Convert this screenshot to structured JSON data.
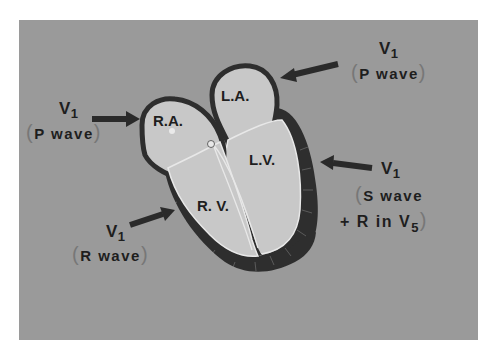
{
  "diagram": {
    "type": "heart-cross-section",
    "chambers": {
      "ra": "R.A.",
      "la": "L.A.",
      "rv": "R. V.",
      "lv": "L.V."
    },
    "annotations": {
      "la_lead": {
        "lead": "V",
        "sub": "1",
        "wave": "P wave",
        "open": "(",
        "close": ")"
      },
      "ra_lead": {
        "lead": "V",
        "sub": "1",
        "wave": "P wave",
        "open": "(",
        "close": ")"
      },
      "lv_lead": {
        "lead": "V",
        "sub": "1",
        "wave_line1": "S wave",
        "wave_line2_prefix": "+ R in V",
        "wave_line2_sub": "5",
        "open": "(",
        "close": ")"
      },
      "rv_lead": {
        "lead": "V",
        "sub": "1",
        "wave": "R wave",
        "open": "(",
        "close": ")"
      }
    },
    "colors": {
      "background": "#9a9a9a",
      "chamber_fill": "#c8c8c8",
      "myocardium": "#2e2e2e",
      "arrow": "#2a2a2a"
    }
  }
}
